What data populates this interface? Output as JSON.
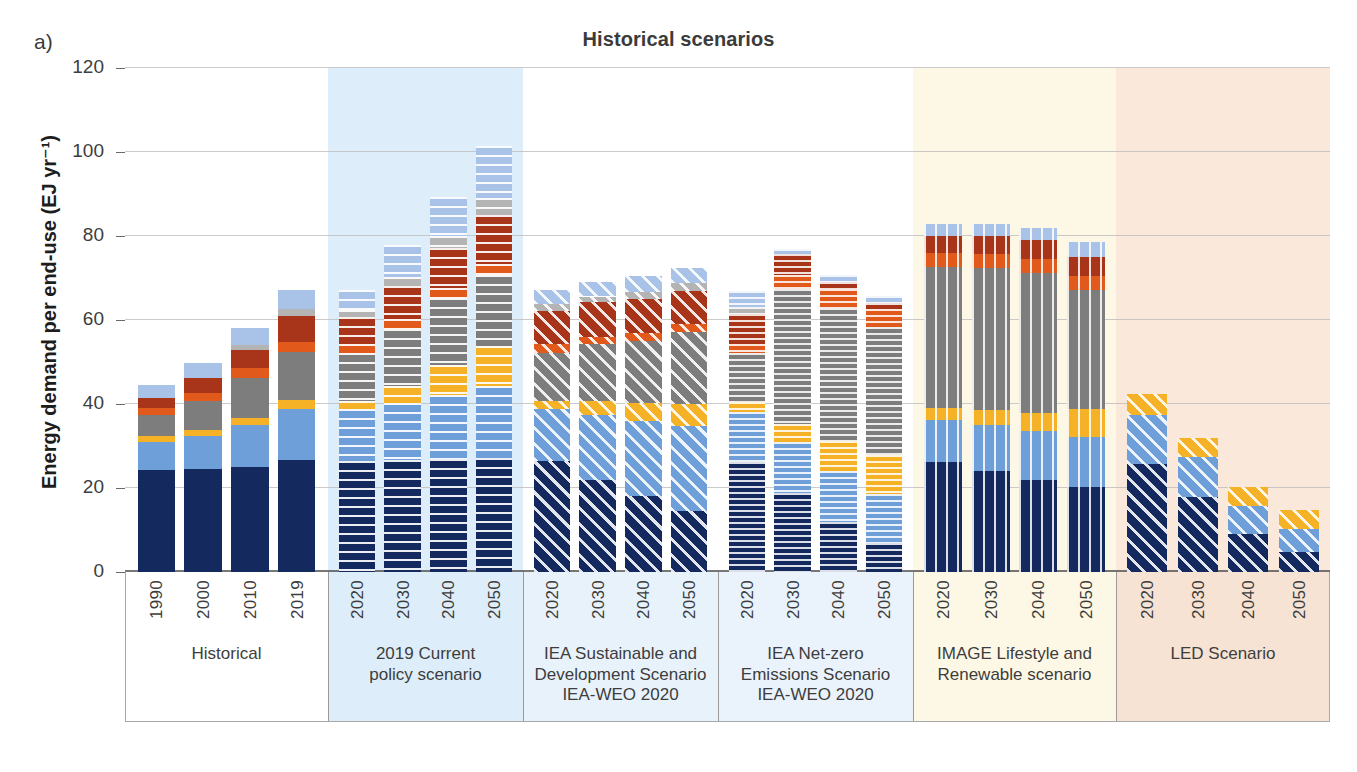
{
  "panel_label": "a)",
  "title": "Historical scenarios",
  "y_axis": {
    "label": "Energy demand per end-use (EJ yr⁻¹)",
    "ticks": [
      0,
      20,
      40,
      60,
      80,
      100,
      120
    ],
    "min": 0,
    "max": 120
  },
  "colors": {
    "navy": "#142a5e",
    "blue": "#6f9fd8",
    "yellow": "#f5b227",
    "gray": "#7d7d7d",
    "orange": "#e2591c",
    "darkred": "#a8341a",
    "lightgray": "#b4b4b4",
    "lightblue": "#a9c2e8",
    "band_historical": "#ffffff",
    "band_current_policy": "#ddeefa",
    "band_sustainable": "#ffffff",
    "band_netzero": "#ffffff",
    "band_image": "#fdf8e6",
    "band_led": "#fae8da",
    "xband_historical": "#ffffff",
    "xband_current_policy": "#ddeefa",
    "xband_sustainable": "#e8f2fb",
    "xband_netzero": "#eaf3fb",
    "xband_image": "#fdf8e6",
    "xband_led": "#f6e3d4"
  },
  "chart_data": {
    "type": "bar",
    "subtype": "stacked",
    "title": "Historical scenarios",
    "xlabel": "",
    "ylabel": "Energy demand per end-use (EJ yr⁻¹)",
    "ylim": [
      0,
      120
    ],
    "ytick_step": 20,
    "grid": true,
    "legend_position": "none",
    "stack_order_bottom_to_top": [
      "navy",
      "blue",
      "yellow",
      "gray",
      "orange",
      "darkred",
      "lightgray",
      "lightblue"
    ],
    "groups": [
      {
        "name": "Historical",
        "label_lines": [
          "Historical"
        ],
        "hatch": "solid",
        "band_color": "#ffffff",
        "categories": [
          "1990",
          "2000",
          "2010",
          "2019"
        ],
        "bars": [
          {
            "x": "1990",
            "total": 44.5,
            "segments": {
              "navy": 24.2,
              "blue": 6.8,
              "yellow": 1.3,
              "gray": 5.2,
              "orange": 1.6,
              "darkred": 2.4,
              "lightgray": 0.0,
              "lightblue": 3.0
            }
          },
          {
            "x": "2000",
            "total": 49.8,
            "segments": {
              "navy": 24.5,
              "blue": 8.0,
              "yellow": 1.3,
              "gray": 7.0,
              "orange": 1.8,
              "darkred": 3.6,
              "lightgray": 0.0,
              "lightblue": 3.6
            }
          },
          {
            "x": "2010",
            "total": 58.0,
            "segments": {
              "navy": 25.0,
              "blue": 10.0,
              "yellow": 1.7,
              "gray": 9.5,
              "orange": 2.3,
              "darkred": 4.3,
              "lightgray": 1.2,
              "lightblue": 4.0
            }
          },
          {
            "x": "2019",
            "total": 67.2,
            "segments": {
              "navy": 26.6,
              "blue": 12.3,
              "yellow": 2.0,
              "gray": 11.5,
              "orange": 2.3,
              "darkred": 6.2,
              "lightgray": 1.8,
              "lightblue": 4.5
            }
          }
        ]
      },
      {
        "name": "2019 Current policy scenario",
        "label_lines": [
          "2019 Current",
          "policy scenario"
        ],
        "hatch": "horizontal",
        "band_color": "#ddeefa",
        "categories": [
          "2020",
          "2030",
          "2040",
          "2050"
        ],
        "bars": [
          {
            "x": "2020",
            "total": 67.2,
            "segments": {
              "navy": 26.5,
              "blue": 12.2,
              "yellow": 2.0,
              "gray": 11.5,
              "orange": 2.2,
              "darkred": 6.3,
              "lightgray": 1.8,
              "lightblue": 4.7
            }
          },
          {
            "x": "2030",
            "total": 77.8,
            "segments": {
              "navy": 26.7,
              "blue": 13.5,
              "yellow": 4.2,
              "gray": 13.5,
              "orange": 2.3,
              "darkred": 8.0,
              "lightgray": 2.1,
              "lightblue": 7.5
            }
          },
          {
            "x": "2040",
            "total": 89.2,
            "segments": {
              "navy": 27.0,
              "blue": 15.2,
              "yellow": 7.0,
              "gray": 16.0,
              "orange": 2.5,
              "darkred": 9.5,
              "lightgray": 2.7,
              "lightblue": 9.3
            }
          },
          {
            "x": "2050",
            "total": 101.5,
            "segments": {
              "navy": 27.2,
              "blue": 17.0,
              "yellow": 9.5,
              "gray": 17.0,
              "orange": 2.6,
              "darkred": 11.8,
              "lightgray": 4.0,
              "lightblue": 12.4
            }
          }
        ]
      },
      {
        "name": "IEA Sustainable and Development Scenario IEA-WEO 2020",
        "label_lines": [
          "IEA Sustainable and",
          "Development Scenario",
          "IEA-WEO 2020"
        ],
        "hatch": "diagonal",
        "band_color": "#ffffff",
        "categories": [
          "2020",
          "2030",
          "2040",
          "2050"
        ],
        "bars": [
          {
            "x": "2020",
            "total": 67.2,
            "segments": {
              "navy": 26.5,
              "blue": 12.2,
              "yellow": 2.0,
              "gray": 11.5,
              "orange": 2.0,
              "darkred": 8.0,
              "lightgray": 1.5,
              "lightblue": 3.5
            }
          },
          {
            "x": "2030",
            "total": 69.0,
            "segments": {
              "navy": 22.0,
              "blue": 15.5,
              "yellow": 3.2,
              "gray": 13.5,
              "orange": 1.8,
              "darkred": 8.2,
              "lightgray": 1.4,
              "lightblue": 3.4
            }
          },
          {
            "x": "2040",
            "total": 70.5,
            "segments": {
              "navy": 18.0,
              "blue": 18.0,
              "yellow": 4.3,
              "gray": 14.8,
              "orange": 1.7,
              "darkred": 8.3,
              "lightgray": 1.6,
              "lightblue": 3.8
            }
          },
          {
            "x": "2050",
            "total": 72.5,
            "segments": {
              "navy": 14.6,
              "blue": 20.2,
              "yellow": 5.2,
              "gray": 17.2,
              "orange": 1.8,
              "darkred": 7.8,
              "lightgray": 2.0,
              "lightblue": 3.7
            }
          }
        ]
      },
      {
        "name": "IEA Net-zero Emissions Scenario IEA-WEO 2020",
        "label_lines": [
          "IEA Net-zero",
          "Emissions Scenario",
          "IEA-WEO 2020"
        ],
        "hatch": "fine-horizontal",
        "band_color": "#ffffff",
        "categories": [
          "2020",
          "2030",
          "2040",
          "2050"
        ],
        "bars": [
          {
            "x": "2020",
            "total": 67.0,
            "segments": {
              "navy": 26.2,
              "blue": 12.0,
              "yellow": 2.2,
              "gray": 11.8,
              "orange": 2.0,
              "darkred": 7.3,
              "lightgray": 1.6,
              "lightblue": 3.9
            }
          },
          {
            "x": "2030",
            "total": 77.0,
            "segments": {
              "navy": 18.8,
              "blue": 12.2,
              "yellow": 4.3,
              "gray": 32.2,
              "orange": 3.2,
              "darkred": 5.0,
              "lightgray": 0.0,
              "lightblue": 1.3
            }
          },
          {
            "x": "2040",
            "total": 70.8,
            "segments": {
              "navy": 11.8,
              "blue": 12.2,
              "yellow": 7.3,
              "gray": 31.5,
              "orange": 4.5,
              "darkred": 1.7,
              "lightgray": 0.0,
              "lightblue": 1.8
            }
          },
          {
            "x": "2050",
            "total": 65.8,
            "segments": {
              "navy": 7.0,
              "blue": 11.5,
              "yellow": 9.3,
              "gray": 30.5,
              "orange": 4.3,
              "darkred": 1.5,
              "lightgray": 0.0,
              "lightblue": 1.7
            }
          }
        ]
      },
      {
        "name": "IMAGE Lifestyle and Renewable scenario",
        "label_lines": [
          "IMAGE Lifestyle and",
          "Renewable scenario"
        ],
        "hatch": "vertical",
        "band_color": "#fdf8e6",
        "categories": [
          "2020",
          "2030",
          "2040",
          "2050"
        ],
        "bars": [
          {
            "x": "2020",
            "total": 82.8,
            "segments": {
              "navy": 26.3,
              "blue": 9.8,
              "yellow": 3.0,
              "gray": 33.5,
              "orange": 3.3,
              "darkred": 4.2,
              "lightgray": 0.0,
              "lightblue": 2.7
            }
          },
          {
            "x": "2030",
            "total": 82.8,
            "segments": {
              "navy": 24.0,
              "blue": 11.0,
              "yellow": 3.5,
              "gray": 34.0,
              "orange": 3.2,
              "darkred": 4.3,
              "lightgray": 0.0,
              "lightblue": 2.8
            }
          },
          {
            "x": "2040",
            "total": 82.0,
            "segments": {
              "navy": 22.0,
              "blue": 11.5,
              "yellow": 4.3,
              "gray": 33.5,
              "orange": 3.3,
              "darkred": 4.5,
              "lightgray": 0.0,
              "lightblue": 2.9
            }
          },
          {
            "x": "2050",
            "total": 78.5,
            "segments": {
              "navy": 20.3,
              "blue": 11.8,
              "yellow": 6.8,
              "gray": 28.3,
              "orange": 3.3,
              "darkred": 4.5,
              "lightgray": 0.0,
              "lightblue": 3.5
            }
          }
        ]
      },
      {
        "name": "LED Scenario",
        "label_lines": [
          "LED Scenario"
        ],
        "hatch": "diagonal",
        "band_color": "#fae8da",
        "categories": [
          "2020",
          "2030",
          "2040",
          "2050"
        ],
        "bars": [
          {
            "x": "2020",
            "total": 42.5,
            "segments": {
              "navy": 25.8,
              "blue": 11.5,
              "yellow": 5.2,
              "gray": 0.0,
              "orange": 0.0,
              "darkred": 0.0,
              "lightgray": 0.0,
              "lightblue": 0.0
            }
          },
          {
            "x": "2030",
            "total": 32.0,
            "segments": {
              "navy": 17.8,
              "blue": 9.7,
              "yellow": 4.5,
              "gray": 0.0,
              "orange": 0.0,
              "darkred": 0.0,
              "lightgray": 0.0,
              "lightblue": 0.0
            }
          },
          {
            "x": "2040",
            "total": 20.2,
            "segments": {
              "navy": 9.0,
              "blue": 6.7,
              "yellow": 4.5,
              "gray": 0.0,
              "orange": 0.0,
              "darkred": 0.0,
              "lightgray": 0.0,
              "lightblue": 0.0
            }
          },
          {
            "x": "2050",
            "total": 14.8,
            "segments": {
              "navy": 4.8,
              "blue": 5.5,
              "yellow": 4.5,
              "gray": 0.0,
              "orange": 0.0,
              "darkred": 0.0,
              "lightgray": 0.0,
              "lightblue": 0.0
            }
          }
        ]
      }
    ]
  }
}
